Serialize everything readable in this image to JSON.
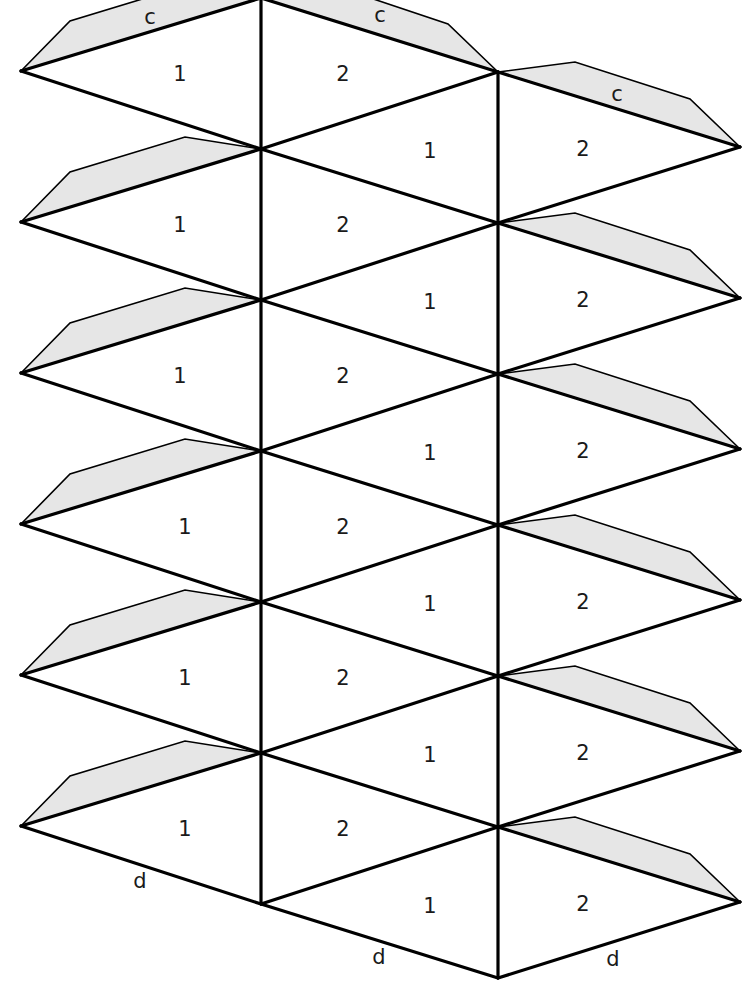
{
  "diagram": {
    "type": "polyhedron-net",
    "colors": {
      "line": "#000000",
      "tab_fill": "#e6e6e6",
      "background": "#ffffff",
      "label": "#1a1a1a"
    },
    "grid": {
      "pitch": 151,
      "left_x": 21,
      "left_y0": 71,
      "left_count": 6,
      "midleft_x": 261,
      "midleft_y0": -2,
      "midleft_count": 7,
      "midright_x": 498,
      "midright_y0": 72,
      "midright_count": 7,
      "right_x": 740,
      "right_y0": 147,
      "right_count": 6
    },
    "tabs": {
      "left_column_count": 6,
      "top_middle": true,
      "right_column_count": 6
    },
    "face_labels": {
      "left_column": "1",
      "middle_upper": "2",
      "middle_lower": "1",
      "right_column": "2"
    },
    "edge_labels": [
      {
        "text": "c",
        "x": 150,
        "y": 18,
        "name": "edge-label-c-left"
      },
      {
        "text": "c",
        "x": 380,
        "y": 16,
        "name": "edge-label-c-middle"
      },
      {
        "text": "c",
        "x": 617,
        "y": 95,
        "name": "edge-label-c-right"
      },
      {
        "text": "d",
        "x": 140,
        "y": 882,
        "name": "edge-label-d-left"
      },
      {
        "text": "d",
        "x": 379,
        "y": 958,
        "name": "edge-label-d-middle"
      },
      {
        "text": "d",
        "x": 613,
        "y": 960,
        "name": "edge-label-d-right"
      }
    ]
  }
}
